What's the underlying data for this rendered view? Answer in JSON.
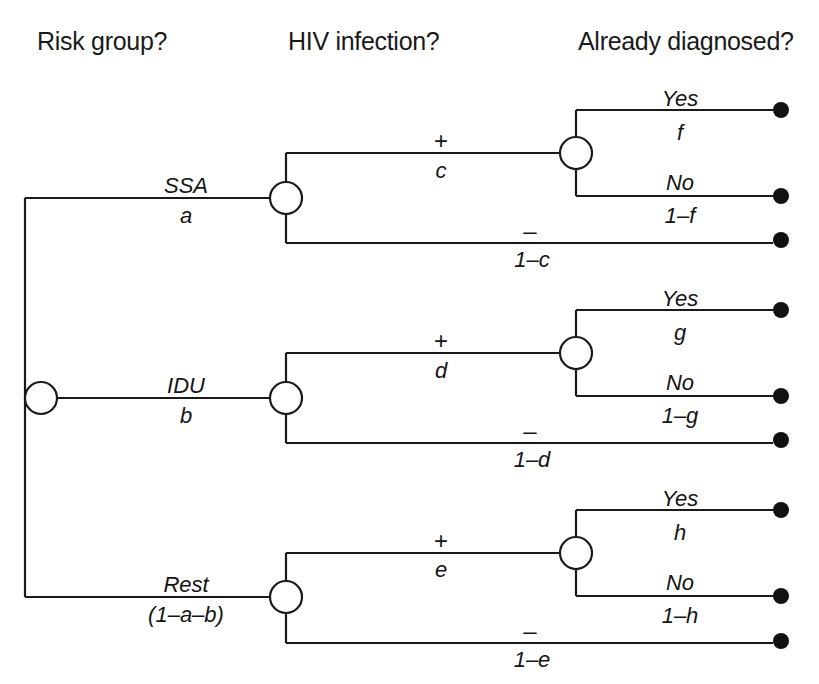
{
  "diagram": {
    "type": "decision-tree",
    "stroke_color": "#1a1a1a",
    "node_fill": "#ffffff",
    "terminal_color": "#111111"
  },
  "columns": [
    {
      "id": "risk-group",
      "label": "Risk group?",
      "x": 37,
      "y": 27
    },
    {
      "id": "hiv-infection",
      "label": "HIV infection?",
      "x": 288,
      "y": 27
    },
    {
      "id": "already-diagnosed",
      "label": "Already diagnosed?",
      "x": 578,
      "y": 27
    }
  ],
  "branches": {
    "risk": [
      {
        "id": "ssa",
        "name": "SSA",
        "prob": "a",
        "name_x": 186,
        "name_y": 175,
        "prob_x": 186,
        "prob_y": 205
      },
      {
        "id": "idu",
        "name": "IDU",
        "prob": "b",
        "name_x": 186,
        "name_y": 375,
        "prob_x": 186,
        "prob_y": 405
      },
      {
        "id": "rest",
        "name": "Rest",
        "prob": "(1–a–b)",
        "name_x": 186,
        "name_y": 574,
        "prob_x": 186,
        "prob_y": 604
      }
    ],
    "hiv": [
      {
        "id": "ssa-pos",
        "sign": "+",
        "prob": "c",
        "sign_x": 441,
        "sign_y": 129,
        "prob_x": 441,
        "prob_y": 160
      },
      {
        "id": "ssa-neg",
        "sign": "–",
        "prob": "1–c",
        "sign_x": 530,
        "sign_y": 219,
        "prob_x": 532,
        "prob_y": 249
      },
      {
        "id": "idu-pos",
        "sign": "+",
        "prob": "d",
        "sign_x": 441,
        "sign_y": 329,
        "prob_x": 441,
        "prob_y": 360
      },
      {
        "id": "idu-neg",
        "sign": "–",
        "prob": "1–d",
        "sign_x": 530,
        "sign_y": 419,
        "prob_x": 532,
        "prob_y": 449
      },
      {
        "id": "rest-pos",
        "sign": "+",
        "prob": "e",
        "sign_x": 441,
        "sign_y": 529,
        "prob_x": 441,
        "prob_y": 559
      },
      {
        "id": "rest-neg",
        "sign": "–",
        "prob": "1–e",
        "sign_x": 530,
        "sign_y": 619,
        "prob_x": 532,
        "prob_y": 649
      }
    ],
    "diagnosed": [
      {
        "id": "ssa-yes",
        "label": "Yes",
        "prob": "f",
        "label_x": 680,
        "label_y": 88,
        "prob_x": 680,
        "prob_y": 122
      },
      {
        "id": "ssa-no",
        "label": "No",
        "prob": "1–f",
        "label_x": 680,
        "label_y": 172,
        "prob_x": 680,
        "prob_y": 205
      },
      {
        "id": "idu-yes",
        "label": "Yes",
        "prob": "g",
        "label_x": 680,
        "label_y": 288,
        "prob_x": 680,
        "prob_y": 322
      },
      {
        "id": "idu-no",
        "label": "No",
        "prob": "1–g",
        "label_x": 680,
        "label_y": 372,
        "prob_x": 680,
        "prob_y": 405
      },
      {
        "id": "rest-yes",
        "label": "Yes",
        "prob": "h",
        "label_x": 680,
        "label_y": 488,
        "prob_x": 680,
        "prob_y": 522
      },
      {
        "id": "rest-no",
        "label": "No",
        "prob": "1–h",
        "label_x": 680,
        "label_y": 572,
        "prob_x": 680,
        "prob_y": 605
      }
    ]
  },
  "geometry": {
    "root_node": {
      "cx": 41,
      "cy": 398,
      "r": 16
    },
    "chance_nodes": [
      {
        "id": "node-ssa",
        "cx": 286,
        "cy": 198,
        "r": 16
      },
      {
        "id": "node-idu",
        "cx": 286,
        "cy": 398,
        "r": 16
      },
      {
        "id": "node-rest",
        "cx": 286,
        "cy": 597,
        "r": 16
      },
      {
        "id": "node-ssa-dx",
        "cx": 576,
        "cy": 153,
        "r": 16
      },
      {
        "id": "node-idu-dx",
        "cx": 576,
        "cy": 353,
        "r": 16
      },
      {
        "id": "node-rest-dx",
        "cx": 576,
        "cy": 553,
        "r": 16
      }
    ],
    "terminals": [
      {
        "id": "terminal-ssa-yes",
        "cx": 781,
        "cy": 110,
        "r": 8
      },
      {
        "id": "terminal-ssa-no",
        "cx": 781,
        "cy": 196,
        "r": 8
      },
      {
        "id": "terminal-ssa-neg",
        "cx": 781,
        "cy": 240,
        "r": 8
      },
      {
        "id": "terminal-idu-yes",
        "cx": 781,
        "cy": 310,
        "r": 8
      },
      {
        "id": "terminal-idu-no",
        "cx": 781,
        "cy": 396,
        "r": 8
      },
      {
        "id": "terminal-idu-neg",
        "cx": 781,
        "cy": 440,
        "r": 8
      },
      {
        "id": "terminal-rest-yes",
        "cx": 781,
        "cy": 510,
        "r": 8
      },
      {
        "id": "terminal-rest-no",
        "cx": 781,
        "cy": 596,
        "r": 8
      },
      {
        "id": "terminal-rest-neg",
        "cx": 781,
        "cy": 641,
        "r": 8
      }
    ]
  }
}
